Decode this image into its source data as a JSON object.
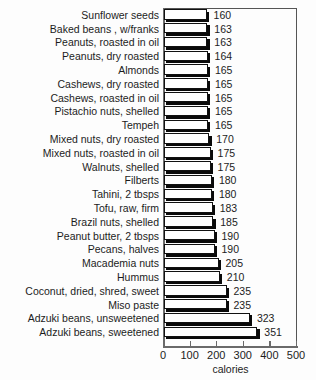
{
  "chart_data": {
    "type": "bar",
    "orientation": "horizontal",
    "title": "",
    "xlabel": "calories",
    "ylabel": "",
    "xlim": [
      0,
      500
    ],
    "xticks": [
      0,
      100,
      200,
      300,
      400,
      500
    ],
    "grid": false,
    "legend": null,
    "value_labels": true,
    "categories": [
      "Sunflower seeds",
      "Baked beans , w/franks",
      "Peanuts, roasted in oil",
      "Peanuts, dry roasted",
      "Almonds",
      "Cashews, dry roasted",
      "Cashews, roasted in oil",
      "Pistachio nuts, shelled",
      "Tempeh",
      "Mixed nuts, dry roasted",
      "Mixed nuts, roasted in oil",
      "Walnuts, shelled",
      "Filberts",
      "Tahini, 2 tbsps",
      "Tofu, raw, firm",
      "Brazil nuts, shelled",
      "Peanut butter, 2 tbsps",
      "Pecans, halves",
      "Macademia nuts",
      "Hummus",
      "Coconut, dried, shred, sweet",
      "Miso paste",
      "Adzuki beans, unsweetened",
      "Adzuki beans, sweetened"
    ],
    "values": [
      160,
      163,
      163,
      164,
      165,
      165,
      165,
      165,
      165,
      170,
      175,
      175,
      180,
      180,
      183,
      185,
      190,
      190,
      205,
      210,
      235,
      235,
      323,
      351
    ]
  },
  "axis": {
    "tick_labels": [
      "0",
      "100",
      "200",
      "300",
      "400",
      "500"
    ],
    "title": "calories"
  },
  "title_remnant": "",
  "colors": {
    "bar_face": "#ffffff",
    "bar_border": "#111111",
    "bar_shadow": "#0a0a0a",
    "axis": "#6a6a6a",
    "text": "#1c1c1c",
    "background": "#fdfdfd"
  }
}
